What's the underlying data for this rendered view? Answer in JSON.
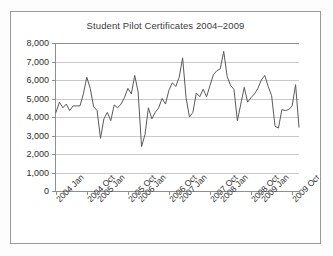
{
  "chart_data": {
    "type": "line",
    "title": "Student Pilot Certificates 2004–2009",
    "xlabel": "",
    "ylabel": "",
    "ylim": [
      0,
      8000
    ],
    "ytick_labels": [
      "8,000",
      "7,000",
      "6,000",
      "5,000",
      "4,000",
      "3,000",
      "2,000",
      "1,000",
      "0"
    ],
    "ytick_values": [
      8000,
      7000,
      6000,
      5000,
      4000,
      3000,
      2000,
      1000,
      0
    ],
    "grid": true,
    "legend": "none",
    "xtick_labels": [
      "2004 Jan",
      "2004 Oct",
      "2005 Jan",
      "2005 Oct",
      "2006 Jan",
      "2006 Oct",
      "2007 Jan",
      "2007 Oct",
      "2008 Jan",
      "2008 Oct",
      "2009 Jan",
      "2009 Oct"
    ],
    "xtick_indices": [
      0,
      9,
      12,
      21,
      24,
      33,
      36,
      45,
      48,
      57,
      60,
      69
    ],
    "x": [
      "2004 Jan",
      "2004 Feb",
      "2004 Mar",
      "2004 Apr",
      "2004 May",
      "2004 Jun",
      "2004 Jul",
      "2004 Aug",
      "2004 Sep",
      "2004 Oct",
      "2004 Nov",
      "2004 Dec",
      "2005 Jan",
      "2005 Feb",
      "2005 Mar",
      "2005 Apr",
      "2005 May",
      "2005 Jun",
      "2005 Jul",
      "2005 Aug",
      "2005 Sep",
      "2005 Oct",
      "2005 Nov",
      "2005 Dec",
      "2006 Jan",
      "2006 Feb",
      "2006 Mar",
      "2006 Apr",
      "2006 May",
      "2006 Jun",
      "2006 Jul",
      "2006 Aug",
      "2006 Sep",
      "2006 Oct",
      "2006 Nov",
      "2006 Dec",
      "2007 Jan",
      "2007 Feb",
      "2007 Mar",
      "2007 Apr",
      "2007 May",
      "2007 Jun",
      "2007 Jul",
      "2007 Aug",
      "2007 Sep",
      "2007 Oct",
      "2007 Nov",
      "2007 Dec",
      "2008 Jan",
      "2008 Feb",
      "2008 Mar",
      "2008 Apr",
      "2008 May",
      "2008 Jun",
      "2008 Jul",
      "2008 Aug",
      "2008 Sep",
      "2008 Oct",
      "2008 Nov",
      "2008 Dec",
      "2009 Jan",
      "2009 Feb",
      "2009 Mar",
      "2009 Apr",
      "2009 May",
      "2009 Jun",
      "2009 Jul",
      "2009 Aug",
      "2009 Sep",
      "2009 Oct",
      "2009 Nov",
      "2009 Dec"
    ],
    "values": [
      4250,
      4800,
      4500,
      4700,
      4350,
      4600,
      4600,
      4600,
      5250,
      6150,
      5550,
      4550,
      4350,
      2850,
      3900,
      4250,
      3800,
      4650,
      4500,
      4700,
      5050,
      5550,
      5250,
      6250,
      5350,
      2400,
      3050,
      4500,
      3900,
      4250,
      4500,
      5000,
      4700,
      5450,
      5850,
      5650,
      6150,
      7200,
      5050,
      4000,
      4250,
      5300,
      5100,
      5500,
      5100,
      5700,
      6300,
      6500,
      6600,
      7550,
      6200,
      5700,
      5500,
      3800,
      4700,
      5600,
      4800,
      5050,
      5250,
      5550,
      6000,
      6250,
      5650,
      5150,
      3500,
      3400,
      4400,
      4350,
      4400,
      4600,
      5750,
      3450
    ]
  }
}
